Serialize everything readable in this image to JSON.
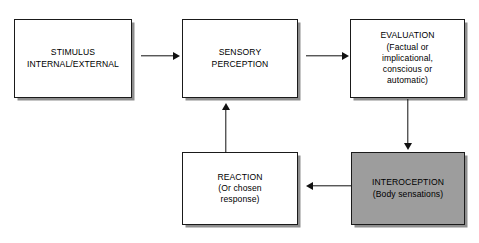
{
  "diagram": {
    "background_color": "#ffffff",
    "stroke_color": "#1a1a1a",
    "shadow_color": "#8e8e8e",
    "shaded_fill": "#9d9d9d",
    "nodes": [
      {
        "id": "stimulus",
        "text": "STIMULUS\nINTERNAL/EXTERNAL",
        "fill": "#ffffff"
      },
      {
        "id": "sensory-perception",
        "text": "SENSORY\nPERCEPTION",
        "fill": "#ffffff"
      },
      {
        "id": "evaluation",
        "text": "EVALUATION\n(Factual or\nimplicational,\nconscious or\nautomatic)",
        "fill": "#ffffff"
      },
      {
        "id": "interoception",
        "text": "INTEROCEPTION\n(Body sensations)",
        "fill": "#9d9d9d"
      },
      {
        "id": "reaction",
        "text": "REACTION\n(Or chosen\nresponse)",
        "fill": "#ffffff"
      }
    ],
    "connectors": [
      {
        "id": "stimulus-to-sensory",
        "from": "stimulus",
        "to": "sensory-perception",
        "direction": "right"
      },
      {
        "id": "sensory-to-evaluation",
        "from": "sensory-perception",
        "to": "evaluation",
        "direction": "right"
      },
      {
        "id": "evaluation-to-interoception",
        "from": "evaluation",
        "to": "interoception",
        "direction": "down"
      },
      {
        "id": "interoception-to-reaction",
        "from": "interoception",
        "to": "reaction",
        "direction": "left"
      },
      {
        "id": "reaction-to-sensory",
        "from": "reaction",
        "to": "sensory-perception",
        "direction": "up"
      }
    ]
  }
}
